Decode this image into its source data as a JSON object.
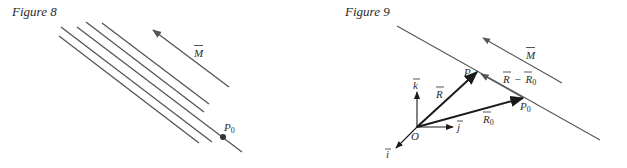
{
  "figures": [
    {
      "title": "Figure 8",
      "labels": {
        "vector": "M",
        "point": "P",
        "point_sub": "0"
      }
    },
    {
      "title": "Figure 9",
      "labels": {
        "vector_m": "M",
        "k": "k",
        "j": "j",
        "i": "i",
        "origin": "O",
        "r": "R",
        "r0": "R",
        "r0_sub": "0",
        "point_p": "P",
        "point_p0": "P",
        "point_p0_sub": "0",
        "diff_left": "R",
        "diff_minus": "−",
        "diff_right": "R",
        "diff_right_sub": "0"
      }
    }
  ],
  "colors": {
    "line": "#555555",
    "vector": "#1a1a1a",
    "text": "#2a2a2a"
  }
}
